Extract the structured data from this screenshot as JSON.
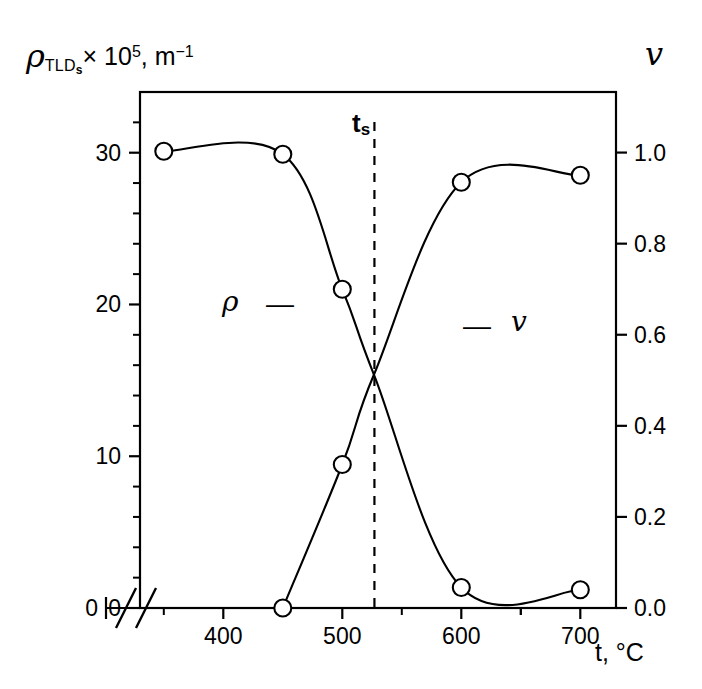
{
  "chart_data": {
    "type": "line",
    "title": "",
    "xlabel": "t, °C",
    "ylabel_left": "ρTLDs × 10^5, m^-1",
    "ylabel_right": "v",
    "xlim": [
      330,
      730
    ],
    "ylim_left": [
      0,
      34
    ],
    "ylim_right": [
      0.0,
      1.133
    ],
    "grid": false,
    "legend_position": "inside-plot",
    "axis_break": "//",
    "x_ticks": [
      400,
      500,
      600,
      700
    ],
    "x_tick_labels": [
      "400",
      "500",
      "600",
      "700"
    ],
    "x_minor_ticks": [
      350,
      450,
      550,
      650,
      700
    ],
    "y_ticks_left": [
      0,
      10,
      20,
      30
    ],
    "y_tick_labels_left": [
      "0",
      "10",
      "20",
      "30"
    ],
    "y_minor_step_left": 2,
    "y_ticks_right": [
      0.0,
      0.2,
      0.4,
      0.6,
      0.8,
      1.0
    ],
    "y_tick_labels_right": [
      "0.0",
      "0.2",
      "0.4",
      "0.6",
      "0.8",
      "1.0"
    ],
    "series": [
      {
        "name": "rho",
        "symbol": "ρ",
        "axis": "left",
        "marker": "open-circle",
        "x": [
          350,
          450,
          500,
          527,
          600,
          700
        ],
        "values": [
          30.1,
          29.9,
          21.0,
          15.3,
          1.35,
          1.2
        ]
      },
      {
        "name": "v",
        "symbol": "v",
        "axis": "right",
        "marker": "open-circle",
        "x": [
          450,
          500,
          527,
          600,
          700
        ],
        "values": [
          0.0,
          0.315,
          0.515,
          0.935,
          0.95
        ]
      }
    ],
    "annotations": [
      {
        "id": "rho-label",
        "text": "ρ",
        "dash": "—",
        "x_px": 222,
        "y_px": 288
      },
      {
        "id": "v-label",
        "text": "v",
        "dash": "—",
        "x_px": 463,
        "y_px": 312
      },
      {
        "id": "ts-label",
        "text": "t",
        "sub": "s",
        "x_px": 352,
        "y_px": 110
      }
    ],
    "reference_line": {
      "id": "ts-line",
      "orientation": "vertical",
      "style": "dashed",
      "x_value": 527
    }
  },
  "labels": {
    "y_left_rho": "ρ",
    "y_left_sub": "TLD",
    "y_left_sub_s": "s",
    "y_left_times": "× 10",
    "y_left_exp": "5",
    "y_left_unit": ", m",
    "y_left_unit_exp": "−1",
    "y_right": "v",
    "x_axis": "t, °C",
    "ts": "t",
    "ts_sub": "s",
    "rho_series": "ρ",
    "v_series": "v",
    "dash": "—"
  },
  "colors": {
    "background": "#ffffff",
    "ink": "#000000",
    "curve": "#000000"
  }
}
